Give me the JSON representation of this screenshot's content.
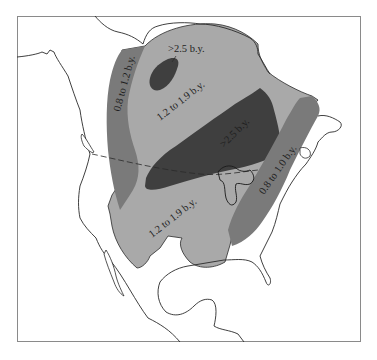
{
  "map": {
    "title": "",
    "regions": [
      {
        "id": "northwest-young-belt",
        "label": "0.8 to 1.2 b.y.",
        "shade": "#7a7a7a"
      },
      {
        "id": "main-province",
        "label": "1.2 to 1.9 b.y.",
        "shade": "#a9a9a9"
      },
      {
        "id": "southern-province",
        "label": "1.2 to 1.9 b.y.",
        "shade": "#a9a9a9"
      },
      {
        "id": "north-old-core",
        "label": ">2.5 b.y.",
        "shade": "#3f3f3f"
      },
      {
        "id": "central-old-core",
        "label": ">2.5 b.y.",
        "shade": "#3f3f3f"
      },
      {
        "id": "east-young-belt",
        "label": "0.8 to 1.0 b.y.",
        "shade": "#7a7a7a"
      }
    ],
    "colors": {
      "background": "#ffffff",
      "frame": "#8a8a8a",
      "coastline": "#2a2a2a",
      "dark": "#3f3f3f",
      "medium": "#7a7a7a",
      "light": "#a9a9a9"
    }
  }
}
